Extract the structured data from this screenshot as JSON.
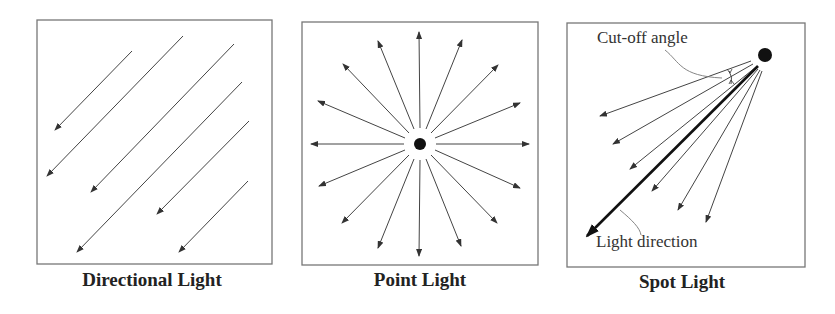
{
  "panels": [
    {
      "id": "directional",
      "caption": "Directional Light",
      "box": {
        "x": 37,
        "y": 20,
        "w": 235,
        "h": 244
      },
      "arrows": [
        [
          132,
          51,
          55,
          130
        ],
        [
          183,
          36,
          47,
          176
        ],
        [
          234,
          44,
          91,
          192
        ],
        [
          242,
          82,
          77,
          252
        ],
        [
          249,
          121,
          157,
          214
        ],
        [
          248,
          181,
          179,
          252
        ]
      ]
    },
    {
      "id": "point",
      "caption": "Point Light",
      "box": {
        "x": 302,
        "y": 22,
        "w": 236,
        "h": 243
      },
      "source": {
        "cx": 420,
        "cy": 144,
        "r": 6
      },
      "arrows": [
        [
          420,
          128,
          419,
          32
        ],
        [
          420,
          160,
          419,
          256
        ],
        [
          404,
          144,
          311,
          144
        ],
        [
          436,
          144,
          529,
          144
        ],
        [
          414,
          129,
          378,
          41
        ],
        [
          426,
          129,
          462,
          40
        ],
        [
          409,
          133,
          343,
          64
        ],
        [
          431,
          133,
          498,
          65
        ],
        [
          405,
          138,
          318,
          101
        ],
        [
          435,
          138,
          520,
          103
        ],
        [
          405,
          150,
          319,
          186
        ],
        [
          435,
          150,
          520,
          188
        ],
        [
          409,
          155,
          342,
          223
        ],
        [
          431,
          155,
          497,
          223
        ],
        [
          414,
          159,
          378,
          248
        ],
        [
          426,
          159,
          461,
          246
        ]
      ]
    },
    {
      "id": "spot",
      "caption": "Spot Light",
      "box": {
        "x": 567,
        "y": 23,
        "w": 238,
        "h": 244
      },
      "source": {
        "cx": 765,
        "cy": 55,
        "r": 7
      },
      "arrows": [
        [
          751,
          61,
          600,
          116
        ],
        [
          753,
          64,
          613,
          144
        ],
        [
          756,
          67,
          630,
          169
        ],
        [
          758,
          69,
          652,
          191
        ],
        [
          760,
          70,
          678,
          210
        ],
        [
          762,
          71,
          706,
          222
        ]
      ],
      "main_direction": [
        758,
        66,
        587,
        236
      ],
      "annotations": {
        "cutoff_label": "Cut-off angle",
        "direction_label": "Light direction"
      }
    }
  ],
  "colors": {
    "line": "#444444",
    "border": "#777777",
    "source": "#111111"
  }
}
